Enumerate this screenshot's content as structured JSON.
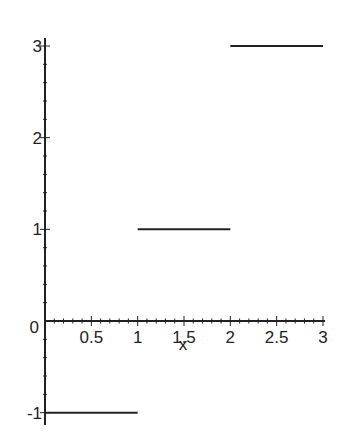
{
  "chart_data": {
    "type": "line",
    "title": "",
    "xlabel": "x",
    "ylabel": "",
    "xlim": [
      0,
      3
    ],
    "ylim": [
      -1,
      3
    ],
    "grid": false,
    "legend": null,
    "x_ticks": [
      "0.5",
      "1",
      "1.5",
      "2",
      "2.5",
      "3"
    ],
    "y_ticks": [
      "-1",
      "1",
      "2",
      "3"
    ],
    "origin_label": "0",
    "line_color": "#222222",
    "series": [
      {
        "name": "piecewise step function",
        "segments": [
          {
            "x": [
              0,
              1
            ],
            "y": [
              -1,
              -1
            ]
          },
          {
            "x": [
              1,
              2
            ],
            "y": [
              1,
              1
            ]
          },
          {
            "x": [
              2,
              3
            ],
            "y": [
              3,
              3
            ]
          }
        ]
      }
    ]
  }
}
